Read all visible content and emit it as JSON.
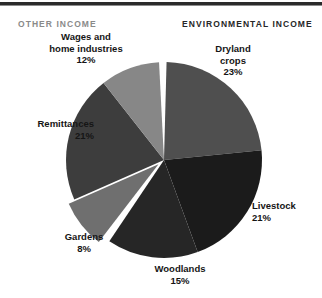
{
  "figure": {
    "background_color": "#ffffff",
    "width": 322,
    "height": 298,
    "rule_color": "#2b2b2b"
  },
  "headers": {
    "other_income": "OTHER INCOME",
    "other_income_color": "#8a8a8a",
    "environmental_income": "ENVIRONMENTAL INCOME",
    "environmental_income_color": "#272727"
  },
  "labels": {
    "wages": {
      "name_line1": "Wages and",
      "name_line2": "home industries",
      "pct": "12%"
    },
    "dryland": {
      "name_line1": "Dryland",
      "name_line2": "crops",
      "pct": "23%"
    },
    "remittances": {
      "name_line1": "Remittances",
      "name_line2": "",
      "pct": "21%"
    },
    "livestock": {
      "name_line1": "Livestock",
      "name_line2": "",
      "pct": "21%"
    },
    "gardens": {
      "name_line1": "Gardens",
      "name_line2": "",
      "pct": "8%"
    },
    "woodlands": {
      "name_line1": "Woodlands",
      "name_line2": "",
      "pct": "15%"
    }
  },
  "footnote": {
    "text": ""
  },
  "chart_data": {
    "type": "pie",
    "title": "",
    "subtitle": "",
    "xlabel": "",
    "ylabel": "",
    "legend_position": "none",
    "grid": false,
    "units": "percent of household income",
    "start_angle_deg": 0,
    "direction": "clockwise",
    "center": {
      "x": 164,
      "y": 160
    },
    "radius": 98,
    "groups": [
      {
        "name": "ENVIRONMENTAL INCOME",
        "total": 67,
        "categories": [
          "Dryland crops",
          "Livestock",
          "Woodlands"
        ]
      },
      {
        "name": "OTHER INCOME",
        "total": 41,
        "categories": [
          "Gardens",
          "Remittances",
          "Wages and home industries"
        ]
      }
    ],
    "categories": [
      "Dryland crops",
      "Livestock",
      "Woodlands",
      "Gardens",
      "Remittances",
      "Wages and home industries"
    ],
    "values": [
      23,
      21,
      15,
      8,
      21,
      12
    ],
    "labels": [
      "23%",
      "21%",
      "15%",
      "8%",
      "21%",
      "12%"
    ],
    "colors": [
      "#4f4f4f",
      "#1b1b1b",
      "#262626",
      "#6f6f6f",
      "#3d3d3d",
      "#878787"
    ],
    "slices": [
      {
        "label": "Dryland crops",
        "value": 23,
        "pct_text": "23%",
        "group": "ENVIRONMENTAL INCOME",
        "color": "#4f4f4f",
        "start_deg": 1.5,
        "end_deg": 84.3,
        "exploded": false
      },
      {
        "label": "Livestock",
        "value": 21,
        "pct_text": "21%",
        "group": "ENVIRONMENTAL INCOME",
        "color": "#1b1b1b",
        "start_deg": 84.3,
        "end_deg": 159.9,
        "exploded": false
      },
      {
        "label": "Woodlands",
        "value": 15,
        "pct_text": "15%",
        "group": "ENVIRONMENTAL INCOME",
        "color": "#262626",
        "start_deg": 159.9,
        "end_deg": 213.9,
        "exploded": false
      },
      {
        "label": "Gardens",
        "value": 8,
        "pct_text": "8%",
        "group": "OTHER INCOME",
        "color": "#6f6f6f",
        "start_deg": 217.5,
        "end_deg": 246.3,
        "exploded": true
      },
      {
        "label": "Remittances",
        "value": 21,
        "pct_text": "21%",
        "group": "OTHER INCOME",
        "color": "#3d3d3d",
        "start_deg": 246.3,
        "end_deg": 321.9,
        "exploded": false
      },
      {
        "label": "Wages and home industries",
        "value": 12,
        "pct_text": "12%",
        "group": "OTHER INCOME",
        "color": "#878787",
        "start_deg": 321.9,
        "end_deg": 357.1,
        "exploded": false
      }
    ]
  }
}
